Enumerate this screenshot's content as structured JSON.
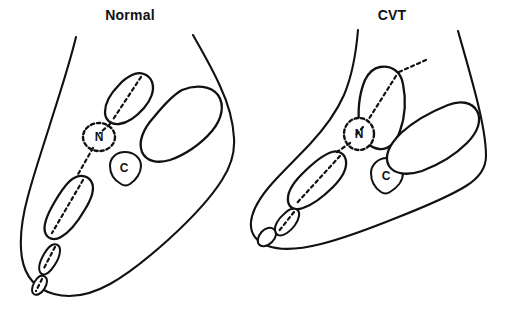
{
  "figure": {
    "background_color": "#ffffff",
    "ink_color": "#111111",
    "width": 519,
    "height": 311
  },
  "panels": [
    {
      "id": "normal",
      "title": "Normal",
      "title_x": 130,
      "title_y": 20,
      "labels": [
        {
          "id": "navicular",
          "text": "N",
          "x": 99,
          "y": 137
        },
        {
          "id": "cuboid",
          "text": "C",
          "x": 124,
          "y": 165
        }
      ],
      "structures": [
        "foot-outline",
        "talus",
        "navicular",
        "cuboid",
        "calcaneus",
        "first-metatarsal",
        "proximal-phalanx",
        "distal-phalanx",
        "talar-axis"
      ]
    },
    {
      "id": "cvt",
      "title": "CVT",
      "title_x": 392,
      "title_y": 20,
      "labels": [
        {
          "id": "navicular",
          "text": "N",
          "x": 359,
          "y": 134
        },
        {
          "id": "cuboid",
          "text": "C",
          "x": 386,
          "y": 173
        }
      ],
      "structures": [
        "foot-outline",
        "talus",
        "navicular",
        "cuboid",
        "calcaneus",
        "first-metatarsal",
        "proximal-phalanx",
        "distal-phalanx",
        "talar-axis"
      ]
    }
  ]
}
